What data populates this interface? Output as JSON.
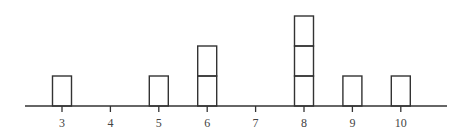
{
  "chart_data": {
    "type": "dotplot",
    "title": "",
    "xlabel": "",
    "ylabel": "",
    "categories": [
      "3",
      "4",
      "5",
      "6",
      "7",
      "8",
      "9",
      "10"
    ],
    "x": [
      3,
      4,
      5,
      6,
      7,
      8,
      9,
      10
    ],
    "values": [
      1,
      0,
      1,
      2,
      0,
      3,
      1,
      1
    ],
    "marker": "square box stacked per observation",
    "xlim": [
      2.2,
      10.9
    ],
    "grid": false,
    "legend": null
  },
  "style": {
    "stroke_color": "#333333",
    "text_color": "#444444",
    "background": "#ffffff"
  }
}
